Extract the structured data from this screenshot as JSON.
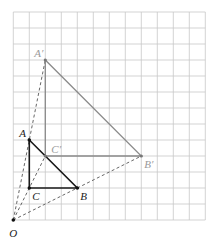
{
  "diagram": {
    "type": "enlargement-on-grid",
    "grid": {
      "origin_px": [
        13.3,
        220.0
      ],
      "cell_px": 16,
      "cols": 12,
      "rows": 13,
      "line_color": "#c8c8c8"
    },
    "center": {
      "label": "O",
      "pos": [
        0,
        0
      ]
    },
    "scale_factor": 2,
    "original_triangle": {
      "color": "#1a1a1a",
      "vertices": [
        {
          "label": "A",
          "pos": [
            1,
            5
          ]
        },
        {
          "label": "B",
          "pos": [
            4,
            2
          ]
        },
        {
          "label": "C",
          "pos": [
            1,
            2
          ]
        }
      ]
    },
    "image_triangle": {
      "color": "#8a8a8a",
      "vertices": [
        {
          "label": "A′",
          "pos": [
            2,
            10
          ]
        },
        {
          "label": "B′",
          "pos": [
            8,
            4
          ]
        },
        {
          "label": "C′",
          "pos": [
            2,
            4
          ]
        }
      ]
    },
    "construction_lines": [
      {
        "from": "O",
        "to": "A′",
        "style": "dashed"
      },
      {
        "from": "O",
        "to": "B′",
        "style": "dashed"
      },
      {
        "from": "O",
        "to": "C′",
        "style": "dashed"
      }
    ],
    "labels": {
      "O": "O",
      "A": "A",
      "B": "B",
      "C": "C",
      "A_prime": "A′",
      "B_prime": "B′",
      "C_prime": "C′"
    }
  }
}
